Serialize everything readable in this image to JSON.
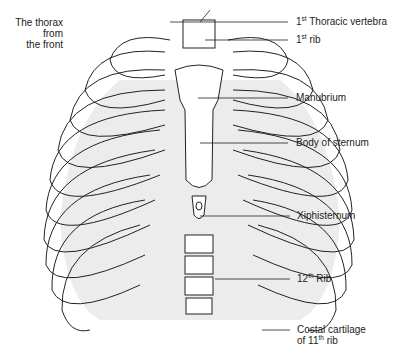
{
  "figure": {
    "title_lines": [
      "The thorax",
      "from",
      "the front"
    ]
  },
  "labels": [
    {
      "id": "first-thoracic-vertebra",
      "num": "1",
      "sup": "st",
      "text": " Thoracic vertebra",
      "line_y": 22
    },
    {
      "id": "first-rib",
      "num": "1",
      "sup": "st",
      "text": " rib",
      "line_y": 40
    },
    {
      "id": "manubrium",
      "num": "",
      "sup": "",
      "text": "Manubrium",
      "line_y": 98
    },
    {
      "id": "body-of-sternum",
      "num": "",
      "sup": "",
      "text": "Body of sternum",
      "line_y": 143
    },
    {
      "id": "xiphisternum",
      "num": "",
      "sup": "",
      "text": "Xiphisternum",
      "line_y": 216
    },
    {
      "id": "twelfth-rib",
      "num": "12",
      "sup": "th",
      "text": " Rib",
      "line_y": 279
    },
    {
      "id": "costal-cartilage",
      "line1": "Costal cartilage",
      "line2_pre": "of 11",
      "line2_sup": "th",
      "line2_post": " rib",
      "line_y": 330
    }
  ],
  "colors": {
    "line": "#222222",
    "shade": "#e6e6e6",
    "background": "#ffffff"
  }
}
